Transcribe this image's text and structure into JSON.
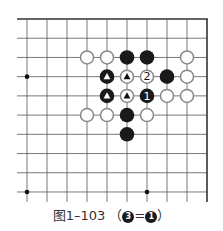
{
  "figure": {
    "caption_prefix": "图1–103",
    "caption_open": "（",
    "caption_eq": "=",
    "caption_close": "）",
    "caption_left_stone_label": "3",
    "caption_right_stone_label": "1"
  },
  "board": {
    "columns": 10,
    "rows": 10,
    "origin_x": 27,
    "origin_y": 19,
    "step_x": 20,
    "step_y": 19.22,
    "edges": [
      "top",
      "right"
    ],
    "line_color": "#555555",
    "edge_color": "#333333",
    "black_color": "#1a1a1a",
    "white_fill": "#ffffff",
    "white_stroke": "#888888",
    "star_points": [
      {
        "col": 0,
        "row": 3
      },
      {
        "col": 0,
        "row": 9
      },
      {
        "col": 6,
        "row": 9
      }
    ],
    "stones": [
      {
        "col": 3,
        "row": 2,
        "color": "white",
        "mark": ""
      },
      {
        "col": 4,
        "row": 2,
        "color": "white",
        "mark": ""
      },
      {
        "col": 5,
        "row": 2,
        "color": "black",
        "mark": ""
      },
      {
        "col": 6,
        "row": 2,
        "color": "black",
        "mark": ""
      },
      {
        "col": 8,
        "row": 2,
        "color": "white",
        "mark": ""
      },
      {
        "col": 4,
        "row": 3,
        "color": "black",
        "mark": "triangle"
      },
      {
        "col": 5,
        "row": 3,
        "color": "white",
        "mark": "triangle"
      },
      {
        "col": 6,
        "row": 3,
        "color": "white",
        "mark": "2"
      },
      {
        "col": 7,
        "row": 3,
        "color": "black",
        "mark": ""
      },
      {
        "col": 8,
        "row": 3,
        "color": "white",
        "mark": ""
      },
      {
        "col": 4,
        "row": 4,
        "color": "black",
        "mark": "triangle"
      },
      {
        "col": 5,
        "row": 4,
        "color": "white",
        "mark": "triangle"
      },
      {
        "col": 6,
        "row": 4,
        "color": "black",
        "mark": "1"
      },
      {
        "col": 7,
        "row": 4,
        "color": "white",
        "mark": ""
      },
      {
        "col": 8,
        "row": 4,
        "color": "white",
        "mark": ""
      },
      {
        "col": 3,
        "row": 5,
        "color": "white",
        "mark": ""
      },
      {
        "col": 4,
        "row": 5,
        "color": "white",
        "mark": ""
      },
      {
        "col": 5,
        "row": 5,
        "color": "black",
        "mark": ""
      },
      {
        "col": 6,
        "row": 5,
        "color": "white",
        "mark": ""
      },
      {
        "col": 5,
        "row": 6,
        "color": "black",
        "mark": ""
      }
    ]
  }
}
